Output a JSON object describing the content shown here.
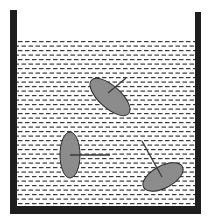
{
  "diagram": {
    "colors": {
      "background": "#ffffff",
      "wall": "#1e1e1e",
      "dash": "#3a3a3a",
      "disk_fill": "#8c8c8c",
      "disk_stroke": "#2a2a2a",
      "arrow": "#3a3a3a"
    },
    "container": {
      "left_wall": {
        "x": 10,
        "y": 10,
        "width": 7,
        "height": 204
      },
      "right_wall": {
        "x": 195,
        "y": 12,
        "width": 6,
        "height": 202
      },
      "bottom_wall": {
        "x": 10,
        "y": 206,
        "width": 191,
        "height": 8
      },
      "liquid_surface_y": 40
    },
    "disks": [
      {
        "id": "top",
        "cx": 110,
        "cy": 97,
        "rx": 25,
        "ry": 11,
        "rotation": 42,
        "arrow": {
          "x1": 108,
          "y1": 93,
          "x2": 126,
          "y2": 78
        }
      },
      {
        "id": "left",
        "cx": 70,
        "cy": 155,
        "rx": 10,
        "ry": 23,
        "rotation": 0,
        "arrow": {
          "x1": 70,
          "y1": 155,
          "x2": 110,
          "y2": 155
        }
      },
      {
        "id": "bottom-right",
        "cx": 163,
        "cy": 177,
        "rx": 22,
        "ry": 11,
        "rotation": -28,
        "arrow": {
          "x1": 162,
          "y1": 177,
          "x2": 142,
          "y2": 141
        }
      }
    ]
  }
}
